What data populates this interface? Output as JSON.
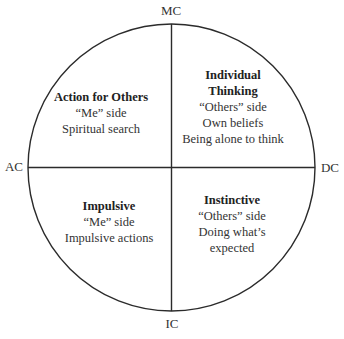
{
  "diagram": {
    "type": "quadrant-circle",
    "axes": {
      "top": "MC",
      "left": "AC",
      "right": "DC",
      "bottom": "IC"
    },
    "quadrants": {
      "top_left": {
        "title": "Action for Others",
        "lines": [
          "“Me” side",
          "Spiritual search"
        ]
      },
      "top_right": {
        "title_lines": [
          "Individual",
          "Thinking"
        ],
        "lines": [
          "“Others” side",
          "Own beliefs",
          "Being alone to think"
        ]
      },
      "bottom_left": {
        "title": "Impulsive",
        "lines": [
          "“Me” side",
          "Impulsive actions"
        ]
      },
      "bottom_right": {
        "title": "Instinctive",
        "lines": [
          "“Others” side",
          "Doing what’s",
          "expected"
        ]
      }
    },
    "colors": {
      "stroke": "#2b2b2b",
      "text": "#333333",
      "background": "#ffffff"
    }
  }
}
